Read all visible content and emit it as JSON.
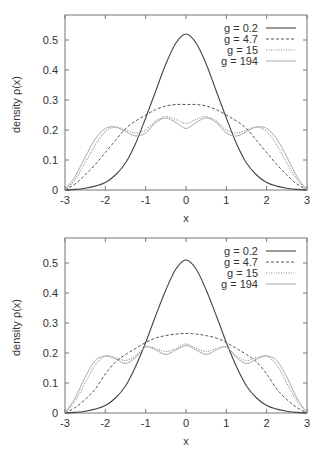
{
  "chart_data": [
    {
      "type": "line",
      "title": "",
      "xlabel": "x",
      "ylabel": "density  ρ(x)",
      "xlim": [
        -3,
        3
      ],
      "ylim": [
        0,
        0.58
      ],
      "xticks": [
        -3,
        -2,
        -1,
        0,
        1,
        2,
        3
      ],
      "yticks": [
        0,
        0.1,
        0.2,
        0.3,
        0.4,
        0.5
      ],
      "xtick_labels": [
        "-3",
        "-2",
        "-1",
        "0",
        "1",
        "2",
        "3"
      ],
      "ytick_labels": [
        "0",
        "0.1",
        "0.2",
        "0.3",
        "0.4",
        "0.5"
      ],
      "grid": false,
      "legend_position": "top-right",
      "x": [
        -3,
        -2.75,
        -2.5,
        -2.25,
        -2,
        -1.75,
        -1.5,
        -1.25,
        -1,
        -0.75,
        -0.5,
        -0.25,
        0,
        0.25,
        0.5,
        0.75,
        1,
        1.25,
        1.5,
        1.75,
        2,
        2.25,
        2.5,
        2.75,
        3
      ],
      "series": [
        {
          "name": "g  = 0.2",
          "style": "solid",
          "color": "#444444",
          "values": [
            0.0,
            0.002,
            0.006,
            0.013,
            0.025,
            0.05,
            0.09,
            0.155,
            0.24,
            0.33,
            0.42,
            0.49,
            0.52,
            0.49,
            0.42,
            0.33,
            0.24,
            0.155,
            0.09,
            0.05,
            0.025,
            0.013,
            0.006,
            0.002,
            0.0
          ]
        },
        {
          "name": "g  = 4.7",
          "style": "dashed",
          "color": "#555555",
          "values": [
            0.0,
            0.02,
            0.05,
            0.085,
            0.125,
            0.165,
            0.205,
            0.23,
            0.25,
            0.268,
            0.28,
            0.285,
            0.285,
            0.285,
            0.28,
            0.268,
            0.25,
            0.23,
            0.205,
            0.165,
            0.125,
            0.085,
            0.05,
            0.02,
            0.0
          ]
        },
        {
          "name": "g   = 15",
          "style": "dotted",
          "color": "#888888",
          "values": [
            0.0,
            0.035,
            0.09,
            0.15,
            0.195,
            0.21,
            0.2,
            0.19,
            0.2,
            0.23,
            0.245,
            0.235,
            0.222,
            0.235,
            0.245,
            0.23,
            0.2,
            0.19,
            0.2,
            0.21,
            0.195,
            0.15,
            0.09,
            0.035,
            0.0
          ]
        },
        {
          "name": "g = 194",
          "style": "solid-light",
          "color": "#aaaaaa",
          "values": [
            0.0,
            0.045,
            0.11,
            0.17,
            0.205,
            0.21,
            0.195,
            0.18,
            0.19,
            0.225,
            0.24,
            0.225,
            0.205,
            0.225,
            0.24,
            0.225,
            0.19,
            0.18,
            0.195,
            0.21,
            0.205,
            0.17,
            0.11,
            0.045,
            0.0
          ]
        }
      ]
    },
    {
      "type": "line",
      "title": "",
      "xlabel": "x",
      "ylabel": "density  ρ(x)",
      "xlim": [
        -3,
        3
      ],
      "ylim": [
        0,
        0.58
      ],
      "xticks": [
        -3,
        -2,
        -1,
        0,
        1,
        2,
        3
      ],
      "yticks": [
        0,
        0.1,
        0.2,
        0.3,
        0.4,
        0.5
      ],
      "xtick_labels": [
        "-3",
        "-2",
        "-1",
        "0",
        "1",
        "2",
        "3"
      ],
      "ytick_labels": [
        "0",
        "0.1",
        "0.2",
        "0.3",
        "0.4",
        "0.5"
      ],
      "grid": false,
      "legend_position": "top-right",
      "x": [
        -3,
        -2.75,
        -2.5,
        -2.25,
        -2,
        -1.75,
        -1.5,
        -1.25,
        -1,
        -0.75,
        -0.5,
        -0.25,
        0,
        0.25,
        0.5,
        0.75,
        1,
        1.25,
        1.5,
        1.75,
        2,
        2.25,
        2.5,
        2.75,
        3
      ],
      "series": [
        {
          "name": "g  = 0.2",
          "style": "solid",
          "color": "#444444",
          "values": [
            0.0,
            0.002,
            0.006,
            0.013,
            0.025,
            0.05,
            0.09,
            0.155,
            0.235,
            0.325,
            0.41,
            0.48,
            0.51,
            0.48,
            0.41,
            0.325,
            0.235,
            0.155,
            0.09,
            0.05,
            0.025,
            0.013,
            0.006,
            0.002,
            0.0
          ]
        },
        {
          "name": "g  = 4.7",
          "style": "dashed",
          "color": "#555555",
          "values": [
            0.0,
            0.018,
            0.045,
            0.08,
            0.13,
            0.17,
            0.195,
            0.215,
            0.235,
            0.25,
            0.258,
            0.263,
            0.265,
            0.263,
            0.258,
            0.25,
            0.235,
            0.215,
            0.195,
            0.17,
            0.13,
            0.08,
            0.045,
            0.018,
            0.0
          ]
        },
        {
          "name": "g   = 15",
          "style": "dotted",
          "color": "#888888",
          "values": [
            0.0,
            0.04,
            0.1,
            0.16,
            0.19,
            0.185,
            0.175,
            0.19,
            0.22,
            0.215,
            0.205,
            0.215,
            0.23,
            0.215,
            0.205,
            0.215,
            0.22,
            0.19,
            0.175,
            0.185,
            0.19,
            0.16,
            0.1,
            0.04,
            0.0
          ]
        },
        {
          "name": "g = 194",
          "style": "solid-light",
          "color": "#aaaaaa",
          "values": [
            0.0,
            0.05,
            0.12,
            0.175,
            0.19,
            0.18,
            0.165,
            0.185,
            0.22,
            0.21,
            0.195,
            0.21,
            0.225,
            0.21,
            0.195,
            0.21,
            0.22,
            0.185,
            0.165,
            0.18,
            0.19,
            0.175,
            0.12,
            0.05,
            0.0
          ]
        }
      ]
    }
  ]
}
